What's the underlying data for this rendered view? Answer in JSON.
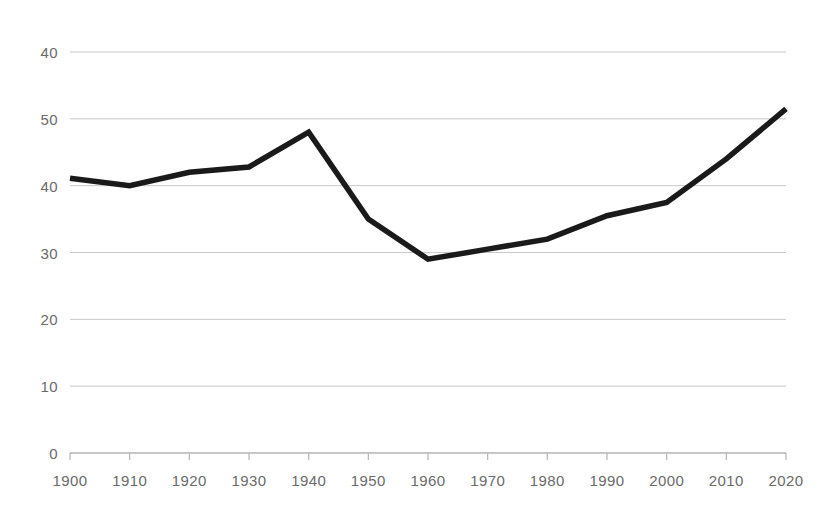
{
  "chart_data": {
    "type": "line",
    "title": "",
    "subtitle": "",
    "xlabel": "",
    "ylabel": "",
    "grid": true,
    "legend": false,
    "legend_position": "none",
    "line_color": "#1a1a1a",
    "grid_color": "#c8c8c8",
    "axis_color": "#b4b4b4",
    "tick_label_color": "#6a6a6a",
    "background_color": "#ffffff",
    "x": [
      1900,
      1910,
      1920,
      1930,
      1940,
      1950,
      1960,
      1970,
      1980,
      1990,
      2000,
      2010,
      2020
    ],
    "values": [
      41.1,
      40.0,
      42.0,
      42.8,
      48.0,
      35.0,
      29.0,
      30.5,
      32.0,
      35.5,
      37.5,
      44.0,
      51.5
    ],
    "categories": [
      "1900",
      "1910",
      "1920",
      "1930",
      "1940",
      "1950",
      "1960",
      "1970",
      "1980",
      "1990",
      "2000",
      "2010",
      "2020"
    ],
    "xlim": [
      1900,
      2020
    ],
    "ylim": [
      0,
      60
    ],
    "y_gridline_values": [
      60,
      50,
      40,
      30,
      20,
      10,
      0
    ],
    "y_tick_labels": [
      "40",
      "50",
      "40",
      "30",
      "20",
      "10",
      "0"
    ],
    "x_tick_labels": [
      "1900",
      "1910",
      "1920",
      "1930",
      "1940",
      "1950",
      "1960",
      "1970",
      "1980",
      "1990",
      "2000",
      "2010",
      "2020"
    ]
  }
}
